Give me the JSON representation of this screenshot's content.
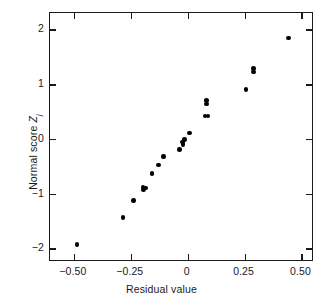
{
  "chart_data": {
    "type": "scatter",
    "title": "",
    "xlabel": "Residual value",
    "ylabel": "Normal score Z",
    "ylabel_subscript": "j",
    "xlim": [
      -0.605,
      0.555
    ],
    "ylim": [
      -2.25,
      2.3
    ],
    "grid": false,
    "legend": null,
    "xticks": [
      -0.5,
      -0.25,
      0,
      0.25,
      0.5
    ],
    "xticklabels": [
      "−0.50",
      "−0.25",
      "0",
      "0.25",
      "0.50"
    ],
    "yticks": [
      2,
      1,
      0,
      -1,
      -2
    ],
    "yticklabels": [
      "2",
      "1",
      "0",
      "−1",
      "−2"
    ],
    "marker": "filled-circle",
    "marker_color": "#000000",
    "points": [
      {
        "x": -0.487,
        "y": -1.925
      },
      {
        "x": -0.285,
        "y": -1.435
      },
      {
        "x": -0.237,
        "y": -1.13
      },
      {
        "x": -0.196,
        "y": -0.88
      },
      {
        "x": -0.194,
        "y": -0.925
      },
      {
        "x": -0.185,
        "y": -0.895
      },
      {
        "x": -0.157,
        "y": -0.63
      },
      {
        "x": -0.128,
        "y": -0.475
      },
      {
        "x": -0.107,
        "y": -0.32
      },
      {
        "x": -0.036,
        "y": -0.19
      },
      {
        "x": -0.022,
        "y": -0.055
      },
      {
        "x": -0.02,
        "y": -0.1
      },
      {
        "x": -0.013,
        "y": -0.015
      },
      {
        "x": 0.009,
        "y": 0.105
      },
      {
        "x": 0.076,
        "y": 0.42
      },
      {
        "x": 0.09,
        "y": 0.42
      },
      {
        "x": 0.082,
        "y": 0.635
      },
      {
        "x": 0.083,
        "y": 0.7
      },
      {
        "x": 0.256,
        "y": 0.9
      },
      {
        "x": 0.288,
        "y": 1.225
      },
      {
        "x": 0.29,
        "y": 1.285
      },
      {
        "x": 0.443,
        "y": 1.84
      }
    ]
  },
  "colors": {
    "axis": "#1a1a1a",
    "marker": "#000000",
    "background": "#ffffff"
  }
}
